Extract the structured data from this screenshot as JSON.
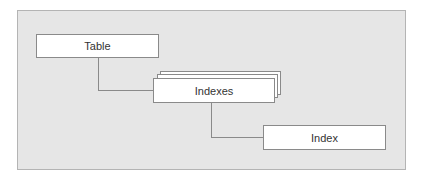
{
  "diagram": {
    "nodes": [
      {
        "id": "table",
        "label": "Table"
      },
      {
        "id": "indexes",
        "label": "Indexes",
        "stacked": true
      },
      {
        "id": "index",
        "label": "Index"
      }
    ],
    "edges": [
      {
        "from": "table",
        "to": "indexes"
      },
      {
        "from": "indexes",
        "to": "index"
      }
    ]
  }
}
